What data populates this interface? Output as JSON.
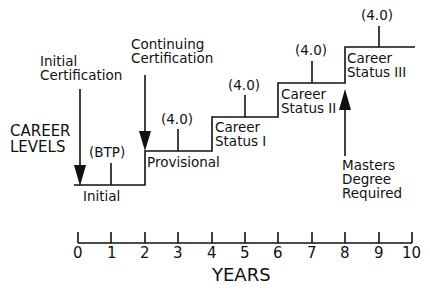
{
  "diagram": {
    "y_axis_title": [
      "CAREER",
      "LEVELS"
    ],
    "x_axis_title": "YEARS",
    "x_ticks": [
      "0",
      "1",
      "2",
      "3",
      "4",
      "5",
      "6",
      "7",
      "8",
      "9",
      "10"
    ],
    "levels": [
      {
        "name": "Initial",
        "label_lines": [
          "Initial"
        ],
        "start_year": 0,
        "end_year": 2,
        "marker": "(BTP)",
        "marker_year": 1
      },
      {
        "name": "Provisional",
        "label_lines": [
          "Provisional"
        ],
        "start_year": 2,
        "end_year": 4,
        "marker": "(4.0)",
        "marker_year": 3
      },
      {
        "name": "Career Status I",
        "label_lines": [
          "Career",
          "Status I"
        ],
        "start_year": 4,
        "end_year": 6,
        "marker": "(4.0)",
        "marker_year": 5
      },
      {
        "name": "Career Status II",
        "label_lines": [
          "Career",
          "Status II"
        ],
        "start_year": 6,
        "end_year": 8,
        "marker": "(4.0)",
        "marker_year": 7
      },
      {
        "name": "Career Status III",
        "label_lines": [
          "Career",
          "Status III"
        ],
        "start_year": 8,
        "end_year": 10,
        "marker": "(4.0)",
        "marker_year": 9
      }
    ],
    "annotations": [
      {
        "text_lines": [
          "Initial",
          "Certification"
        ],
        "year": 0,
        "direction": "down"
      },
      {
        "text_lines": [
          "Continuing",
          "Certification"
        ],
        "year": 2,
        "direction": "down"
      },
      {
        "text_lines": [
          "Masters",
          "Degree",
          "Required"
        ],
        "year": 8,
        "direction": "up"
      }
    ]
  }
}
